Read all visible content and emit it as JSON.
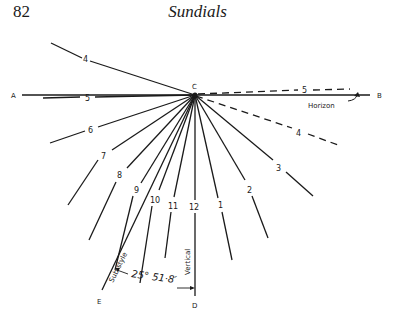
{
  "header": {
    "page_number": "82",
    "running_title": "Sundials"
  },
  "diagram": {
    "points": {
      "A": "A",
      "B": "B",
      "C": "C",
      "D": "D",
      "E": "E"
    },
    "hour_lines_left": [
      "4",
      "5",
      "6",
      "7",
      "8",
      "9",
      "10",
      "11"
    ],
    "noon_line": "12",
    "hour_lines_right": [
      "1",
      "2",
      "3"
    ],
    "dashed_hour_lines": [
      "5",
      "4"
    ],
    "horizon_label": "Horizon",
    "substyle_label": "Sub-style",
    "vertical_label": "Vertical",
    "angle_label": "25° 51·8′"
  }
}
